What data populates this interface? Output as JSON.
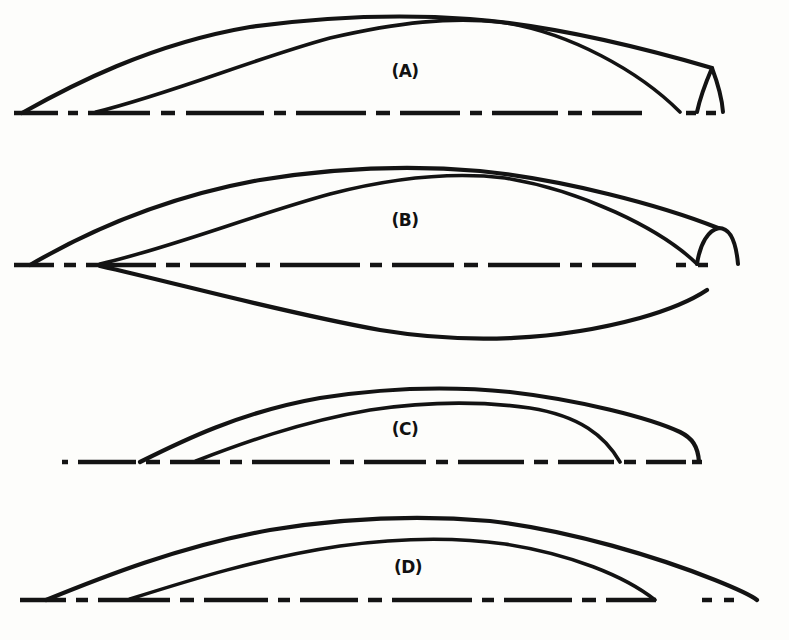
{
  "figure": {
    "kind": "line-diagram",
    "caption_labels": [
      "(A)",
      "(B)",
      "(C)",
      "(D)"
    ],
    "ink_color": "#131313",
    "paper_color": "#fdfdfb",
    "width": 789,
    "height": 640
  },
  "panels": [
    {
      "id": "A",
      "label": "(A)",
      "label_x": 405,
      "label_y": 77,
      "baseline_y": 113,
      "baseline_x1": 14,
      "baseline_x2": 762,
      "has_lower_curve": false,
      "tail_style": "wedge",
      "outer_curve": "M 22,113 C 70,86 150,44 250,27 C 330,16 400,14 470,19 C 560,26 650,50 712,68",
      "inner_curve": "M 96,112 C 170,94 250,60 330,38 C 400,22 450,17 500,22 C 570,32 640,72 680,112",
      "tail_path": "M 712,68 C 706,82 700,98 697,112 M 712,68 C 718,84 722,98 723,112",
      "dash_pattern": "44 10 10 10 62 11 14 11 78 10 12 10 70 10 14 10 60 10 12 10 66 10 14 10 50"
    },
    {
      "id": "B",
      "label": "(B)",
      "label_x": 405,
      "label_y": 226,
      "baseline_y": 265,
      "baseline_x1": 14,
      "baseline_x2": 762,
      "has_lower_curve": true,
      "tail_style": "arch",
      "outer_curve": "M 30,265 C 80,236 160,198 260,180 C 340,167 410,165 480,171 C 565,180 660,205 718,228",
      "inner_curve": "M 100,264 C 170,248 250,216 330,194 C 400,176 455,172 505,178 C 580,190 660,228 697,264",
      "tail_path": "M 697,264 C 700,244 708,230 719,228 C 730,228 736,242 738,264",
      "lower_curve": "M 100,266 C 180,284 280,312 380,330 C 470,345 560,340 640,318 C 672,309 695,298 707,290",
      "dash_pattern": "40 10 12 10 70 10 14 10 56 10 14 10 80 10 12 10 62 10 14 10 72 10 12 10 44"
    },
    {
      "id": "C",
      "label": "(C)",
      "label_x": 405,
      "label_y": 435,
      "baseline_y": 462,
      "baseline_x1": 62,
      "baseline_x2": 742,
      "has_lower_curve": false,
      "tail_style": "shoulder-drop",
      "outer_curve": "M 140,462 C 180,442 240,412 320,398 C 390,387 450,386 510,392 C 580,400 650,418 680,432 C 692,438 698,446 699,462",
      "inner_curve": "M 196,461 C 240,444 300,422 370,410 C 430,401 480,401 530,408 C 580,416 605,436 620,462",
      "tail_path": "",
      "dash_pattern": "6 10 58 10 14 10 50 10 12 10 78 10 14 10 62 10 12 10 66 10 14 10 56 10 12 10 40"
    },
    {
      "id": "D",
      "label": "(D)",
      "label_x": 408,
      "label_y": 573,
      "baseline_y": 600,
      "baseline_x1": 20,
      "baseline_x2": 770,
      "has_lower_curve": false,
      "tail_style": "none",
      "outer_curve": "M 46,600 C 100,578 180,546 270,530 C 350,517 420,515 490,521 C 570,530 660,558 715,580 C 740,590 752,596 757,600",
      "inner_curve": "M 130,599 C 190,580 260,558 340,546 C 405,537 455,537 505,544 C 570,554 625,576 655,600",
      "tail_path": "",
      "dash_pattern": "46 10 12 10 72 10 14 10 64 10 12 10 58 10 14 10 80 10 12 10 68 10 14 10 50"
    }
  ]
}
